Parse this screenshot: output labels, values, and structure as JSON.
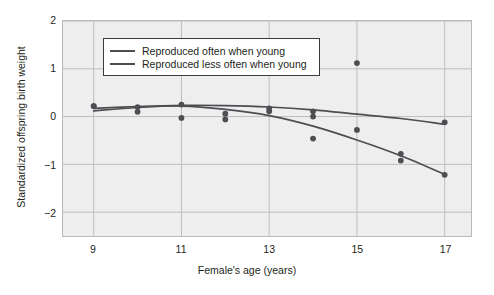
{
  "chart_data": {
    "type": "scatter",
    "title": "",
    "xlabel": "Female's age (years)",
    "ylabel": "Standardized offspring birth weight",
    "xlim": [
      8.3,
      17.6
    ],
    "ylim": [
      -2.5,
      2.0
    ],
    "xticks": [
      9,
      11,
      13,
      15,
      17
    ],
    "yticks": [
      2,
      1,
      0,
      -1,
      -2
    ],
    "xtick_labels": [
      "9",
      "11",
      "13",
      "15",
      "17"
    ],
    "ytick_labels": [
      "2",
      "1",
      "0",
      "−1",
      "−2"
    ],
    "grid": true,
    "legend_position": "upper left",
    "series": [
      {
        "name": "Reproduced often when young",
        "color": "#4d4d52",
        "points": [
          {
            "x": 9,
            "y": 0.22
          },
          {
            "x": 10,
            "y": 0.2
          },
          {
            "x": 11,
            "y": 0.25
          },
          {
            "x": 13,
            "y": 0.17
          },
          {
            "x": 14,
            "y": 0.11
          },
          {
            "x": 15,
            "y": 1.12
          },
          {
            "x": 16,
            "y": -0.78
          },
          {
            "x": 17,
            "y": -0.12
          }
        ],
        "fit_curve": [
          {
            "x": 9,
            "y": 0.17
          },
          {
            "x": 10,
            "y": 0.21
          },
          {
            "x": 11,
            "y": 0.235
          },
          {
            "x": 12,
            "y": 0.23
          },
          {
            "x": 13,
            "y": 0.2
          },
          {
            "x": 14,
            "y": 0.14
          },
          {
            "x": 15,
            "y": 0.05
          },
          {
            "x": 16,
            "y": -0.04
          },
          {
            "x": 17,
            "y": -0.16
          }
        ]
      },
      {
        "name": "Reproduced less often when young",
        "color": "#4d4d52",
        "points": [
          {
            "x": 9,
            "y": 0.22
          },
          {
            "x": 10,
            "y": 0.1
          },
          {
            "x": 11,
            "y": -0.03
          },
          {
            "x": 12,
            "y": 0.06
          },
          {
            "x": 12,
            "y": -0.06
          },
          {
            "x": 13,
            "y": 0.11
          },
          {
            "x": 14,
            "y": 0.0
          },
          {
            "x": 14,
            "y": -0.46
          },
          {
            "x": 15,
            "y": -0.28
          },
          {
            "x": 16,
            "y": -0.92
          },
          {
            "x": 17,
            "y": -1.22
          }
        ],
        "fit_curve": [
          {
            "x": 9,
            "y": 0.12
          },
          {
            "x": 10,
            "y": 0.19
          },
          {
            "x": 11,
            "y": 0.22
          },
          {
            "x": 12,
            "y": 0.15
          },
          {
            "x": 13,
            "y": 0.02
          },
          {
            "x": 14,
            "y": -0.2
          },
          {
            "x": 15,
            "y": -0.49
          },
          {
            "x": 16,
            "y": -0.82
          },
          {
            "x": 17,
            "y": -1.21
          }
        ]
      }
    ]
  },
  "legend": {
    "items": [
      {
        "label": "Reproduced often when young"
      },
      {
        "label": "Reproduced less often when young"
      }
    ]
  },
  "colors": {
    "plot_background": "#eeeeee",
    "grid": "#bdbdbd",
    "frame": "#b9b9b9",
    "line": "#4d4d52",
    "marker": "#4d4d52",
    "text": "#231f20"
  }
}
